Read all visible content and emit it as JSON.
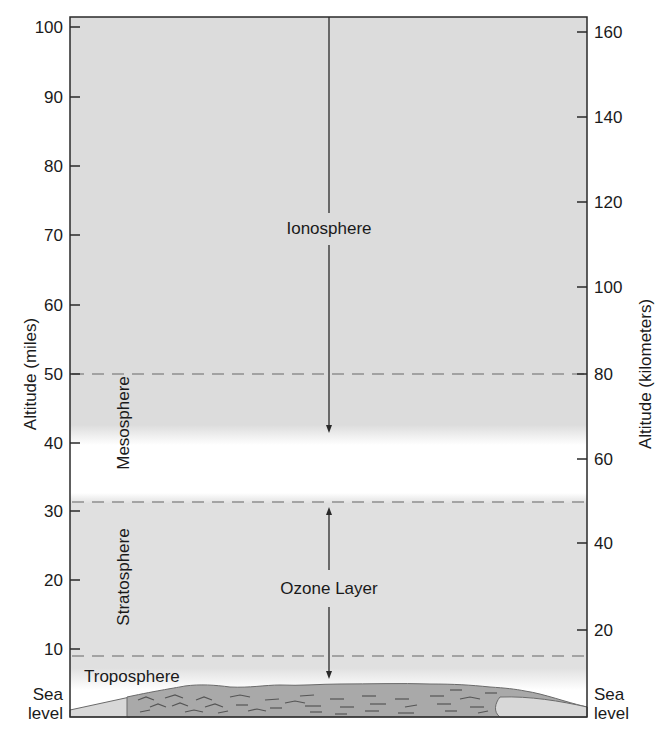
{
  "diagram": {
    "left_axis": {
      "title": "Altitude (miles)",
      "ticks": [
        "100",
        "90",
        "80",
        "70",
        "60",
        "50",
        "40",
        "30",
        "20",
        "10"
      ],
      "bottom_label_line1": "Sea",
      "bottom_label_line2": "level"
    },
    "right_axis": {
      "title": "Altitude (kilometers)",
      "ticks": [
        "160",
        "140",
        "120",
        "100",
        "80",
        "60",
        "40",
        "20"
      ],
      "bottom_label_line1": "Sea",
      "bottom_label_line2": "level"
    },
    "layers": {
      "ionosphere": "Ionosphere",
      "mesosphere": "Mesosphere",
      "stratosphere": "Stratosphere",
      "ozone": "Ozone Layer",
      "troposphere": "Troposphere"
    },
    "boundaries_miles": {
      "ionosphere_lower": 50,
      "stratosphere_upper": 31,
      "troposphere_upper": 9
    },
    "colors": {
      "shaded_layer": "#dcdcdc",
      "clear_band": "#ffffff",
      "land": "#a9a9a9",
      "land_light": "#d8d8d8",
      "axis": "#2a2a2a",
      "dashed": "#8e8e8e"
    }
  }
}
